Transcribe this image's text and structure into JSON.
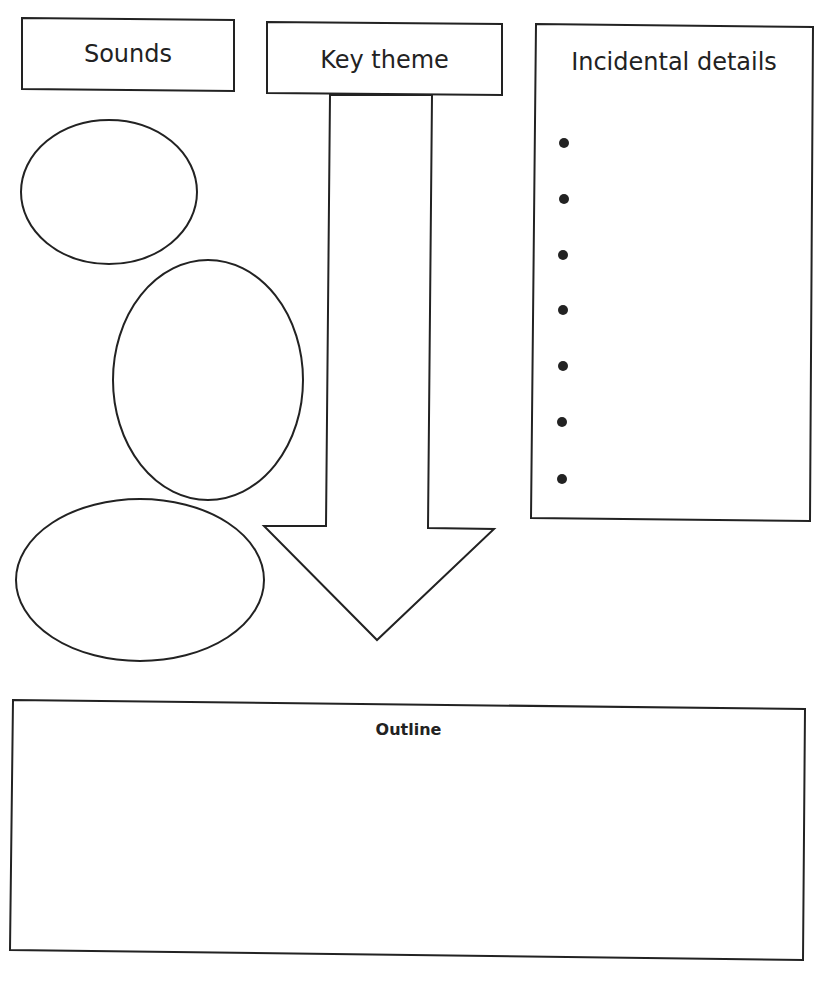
{
  "diagram": {
    "type": "graphic-organizer",
    "boxes": {
      "sounds": {
        "label": "Sounds"
      },
      "key_theme": {
        "label": "Key theme"
      },
      "incidental_details": {
        "label": "Incidental details",
        "bullet_count": 7
      },
      "outline": {
        "label": "Outline"
      }
    },
    "ellipses": [
      {
        "id": "sound-1"
      },
      {
        "id": "sound-2"
      },
      {
        "id": "sound-3"
      }
    ],
    "arrow": {
      "direction": "down",
      "from": "Key theme",
      "to": "Outline"
    },
    "colors": {
      "stroke": "#222222",
      "background": "#ffffff"
    }
  }
}
